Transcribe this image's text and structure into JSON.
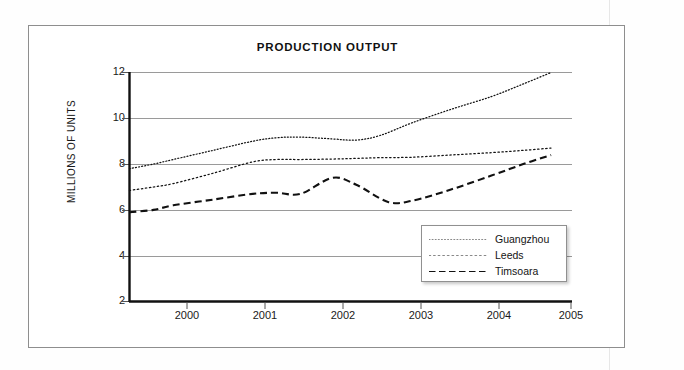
{
  "chart_data": {
    "type": "line",
    "title": "PRODUCTION OUTPUT",
    "xlabel": "",
    "ylabel": "MILLIONS OF UNITS",
    "xlim": [
      1999.45,
      2005
    ],
    "ylim": [
      2,
      12
    ],
    "xticks": [
      "2000",
      "2001",
      "2002",
      "2003",
      "2004",
      "2005"
    ],
    "yticks": [
      "2",
      "4",
      "6",
      "8",
      "10",
      "12"
    ],
    "grid": "horizontal",
    "legend_position": "lower right",
    "series": [
      {
        "name": "Guangzhou",
        "style": "fine-dotted",
        "x": [
          1999.45,
          1999.75,
          2000.0,
          2000.5,
          2001.0,
          2001.3,
          2001.6,
          2002.0,
          2002.3,
          2002.6,
          2003.0,
          2003.5,
          2004.0,
          2004.4,
          2004.75
        ],
        "values": [
          7.8,
          8.0,
          8.2,
          8.6,
          9.0,
          9.15,
          9.18,
          9.1,
          9.05,
          9.25,
          9.8,
          10.4,
          10.95,
          11.5,
          12.0
        ]
      },
      {
        "name": "Leeds",
        "style": "dotted",
        "x": [
          1999.45,
          1999.75,
          2000.0,
          2000.5,
          2001.0,
          2001.3,
          2001.6,
          2002.0,
          2002.3,
          2002.6,
          2003.0,
          2003.5,
          2004.0,
          2004.4,
          2004.75
        ],
        "values": [
          6.85,
          7.0,
          7.15,
          7.6,
          8.1,
          8.2,
          8.2,
          8.22,
          8.25,
          8.28,
          8.3,
          8.4,
          8.5,
          8.6,
          8.7
        ]
      },
      {
        "name": "Timsoara",
        "style": "dashed",
        "x": [
          1999.45,
          1999.75,
          2000.0,
          2000.5,
          2001.0,
          2001.3,
          2001.6,
          2002.0,
          2002.3,
          2002.7,
          2003.0,
          2003.5,
          2004.0,
          2004.4,
          2004.75
        ],
        "values": [
          5.9,
          6.0,
          6.2,
          6.45,
          6.7,
          6.75,
          6.7,
          7.4,
          7.1,
          6.35,
          6.4,
          6.9,
          7.5,
          8.0,
          8.4
        ]
      }
    ]
  },
  "legend": {
    "items": [
      {
        "label": "Guangzhou"
      },
      {
        "label": "Leeds"
      },
      {
        "label": "Timsoara"
      }
    ]
  },
  "colors": {
    "line": "#111111",
    "grid": "#9a9a9a",
    "axis": "#111111",
    "frame": "#8e8e8e"
  }
}
